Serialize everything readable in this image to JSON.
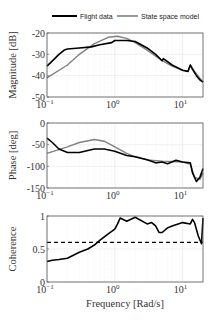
{
  "legend": {
    "entries": [
      {
        "label": "Flight data",
        "color": "#000000",
        "width": 2
      },
      {
        "label": "State space model",
        "color": "#808080",
        "width": 1.6
      }
    ]
  },
  "xaxis": {
    "label": "Frequency [Rad/s]",
    "scale": "log",
    "range": [
      0.1,
      20
    ],
    "ticks": [
      {
        "base": "10",
        "exp": "−1",
        "value": 0.1
      },
      {
        "base": "10",
        "exp": "0",
        "value": 1
      },
      {
        "base": "10",
        "exp": "1",
        "value": 10
      }
    ]
  },
  "chart_data": [
    {
      "type": "line",
      "title": "",
      "xlabel": "Frequency [Rad/s]",
      "ylabel": "Magnitude [dB]",
      "xscale": "log",
      "xlim": [
        0.1,
        20
      ],
      "ylim": [
        -50,
        -20
      ],
      "yticks": [
        -20,
        -30,
        -40,
        -50
      ],
      "ytick_labels": [
        "-20",
        "-30",
        "-40",
        "-50"
      ],
      "grid": true,
      "series": [
        {
          "name": "Flight data",
          "color": "#000000",
          "x": [
            0.1,
            0.13,
            0.15,
            0.18,
            0.2,
            0.3,
            0.45,
            0.6,
            0.9,
            1.0,
            1.5,
            2,
            3,
            4,
            5,
            5.2,
            7,
            10,
            12,
            13,
            14,
            16,
            18,
            20
          ],
          "y": [
            -35.5,
            -32,
            -30,
            -28,
            -27.5,
            -27,
            -26.5,
            -25.5,
            -24.5,
            -23.5,
            -23.5,
            -24,
            -27,
            -30,
            -33,
            -32,
            -35,
            -37.5,
            -38,
            -35,
            -37,
            -40,
            -42,
            -43
          ]
        },
        {
          "name": "State space model",
          "color": "#808080",
          "x": [
            0.1,
            0.2,
            0.3,
            0.5,
            0.8,
            1.1,
            1.5,
            2,
            3,
            5,
            7,
            10,
            12,
            13,
            15,
            20
          ],
          "y": [
            -41,
            -35,
            -30,
            -25,
            -22,
            -21.5,
            -22.5,
            -24.5,
            -28,
            -33,
            -35.5,
            -37.5,
            -38,
            -35,
            -38,
            -43
          ]
        }
      ]
    },
    {
      "type": "line",
      "title": "",
      "xlabel": "Frequency [Rad/s]",
      "ylabel": "Phase [deg]",
      "xscale": "log",
      "xlim": [
        0.1,
        20
      ],
      "ylim": [
        -150,
        0
      ],
      "yticks": [
        0,
        -50,
        -100,
        -150
      ],
      "ytick_labels": [
        "0",
        "-50",
        "-100",
        "-150"
      ],
      "grid": true,
      "series": [
        {
          "name": "Flight data",
          "color": "#000000",
          "x": [
            0.1,
            0.12,
            0.15,
            0.2,
            0.3,
            0.5,
            0.7,
            1.0,
            1.5,
            2,
            3,
            4,
            5,
            6,
            8,
            10,
            13,
            14,
            16,
            18,
            20
          ],
          "y": [
            -35,
            -45,
            -60,
            -68,
            -68,
            -60,
            -60,
            -65,
            -75,
            -78,
            -85,
            -92,
            -90,
            -94,
            -86,
            -90,
            -92,
            -115,
            -135,
            -125,
            -105
          ]
        },
        {
          "name": "State space model",
          "color": "#808080",
          "x": [
            0.1,
            0.2,
            0.3,
            0.5,
            0.7,
            1.0,
            1.5,
            2,
            3,
            5,
            10,
            13,
            15,
            18,
            20
          ],
          "y": [
            -70,
            -55,
            -45,
            -38,
            -42,
            -55,
            -70,
            -78,
            -85,
            -88,
            -90,
            -95,
            -125,
            -130,
            -115
          ]
        }
      ]
    },
    {
      "type": "line",
      "title": "",
      "xlabel": "Frequency [Rad/s]",
      "ylabel": "Coherence",
      "xscale": "log",
      "xlim": [
        0.1,
        20
      ],
      "ylim": [
        0,
        1
      ],
      "yticks": [
        0,
        0.5,
        1
      ],
      "ytick_labels": [
        "0",
        "0.5",
        "1"
      ],
      "grid": true,
      "threshold": {
        "value": 0.6,
        "style": "dashed",
        "color": "#000000"
      },
      "series": [
        {
          "name": "Coherence",
          "color": "#000000",
          "x": [
            0.1,
            0.12,
            0.15,
            0.2,
            0.3,
            0.4,
            0.5,
            0.6,
            0.8,
            1.0,
            1.1,
            1.2,
            1.5,
            2,
            3,
            3.5,
            4,
            4.5,
            5,
            6,
            7,
            10,
            13,
            14,
            15,
            17,
            19,
            20
          ],
          "y": [
            0.31,
            0.33,
            0.34,
            0.36,
            0.45,
            0.5,
            0.56,
            0.63,
            0.73,
            0.8,
            0.88,
            0.97,
            0.92,
            0.98,
            0.88,
            0.9,
            0.85,
            0.75,
            0.75,
            0.82,
            0.85,
            0.9,
            0.88,
            0.95,
            0.9,
            0.7,
            0.58,
            0.97
          ]
        }
      ]
    }
  ]
}
